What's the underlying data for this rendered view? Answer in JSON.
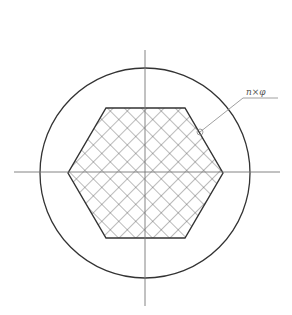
{
  "diagram": {
    "type": "technical-drawing",
    "colors": {
      "outline": "#333333",
      "hatch": "#555555",
      "centerline": "#777777",
      "leader": "#888888",
      "background": "#ffffff"
    },
    "circle": {
      "cx": 145,
      "cy": 173,
      "r": 105
    },
    "hexagon": {
      "points": [
        [
          106,
          108
        ],
        [
          185,
          108
        ],
        [
          223,
          173
        ],
        [
          185,
          238
        ],
        [
          106,
          238
        ],
        [
          68,
          173
        ]
      ]
    },
    "centerlines": {
      "vertical": {
        "x": 145,
        "y1": 50,
        "y2": 306
      },
      "horizontal": {
        "y": 172,
        "x1": 14,
        "x2": 280
      }
    },
    "hatch_spacing": 12,
    "callout": {
      "label": "n×φ",
      "marker": {
        "cx": 200,
        "cy": 132,
        "r": 3
      },
      "leader_points": [
        [
          200,
          132
        ],
        [
          243,
          98
        ],
        [
          278,
          98
        ]
      ],
      "label_x": 246,
      "label_y": 95
    }
  }
}
